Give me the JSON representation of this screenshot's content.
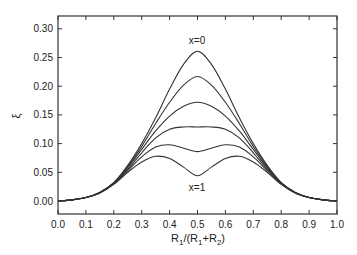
{
  "chart_data": {
    "type": "line",
    "title": "",
    "xlabel": "R1/(R1+R2)",
    "ylabel": "ξ",
    "xlim": [
      0.0,
      1.0
    ],
    "ylim": [
      -0.02,
      0.32
    ],
    "grid": false,
    "legend": null,
    "x_ticks": [
      "0.0",
      "0.1",
      "0.2",
      "0.3",
      "0.4",
      "0.5",
      "0.6",
      "0.7",
      "0.8",
      "0.9",
      "1.0"
    ],
    "y_ticks": [
      "0.00",
      "0.05",
      "0.10",
      "0.15",
      "0.20",
      "0.25",
      "0.30"
    ],
    "annotations": [
      {
        "text": "x=0",
        "x": 0.5,
        "y": 0.275
      },
      {
        "text": "x=1",
        "x": 0.5,
        "y": 0.028
      }
    ],
    "x": [
      0.0,
      0.05,
      0.1,
      0.15,
      0.2,
      0.25,
      0.3,
      0.35,
      0.4,
      0.45,
      0.5,
      0.55,
      0.6,
      0.65,
      0.7,
      0.75,
      0.8,
      0.85,
      0.9,
      0.95,
      1.0
    ],
    "series": [
      {
        "name": "x=0",
        "values": [
          0,
          0.002,
          0.006,
          0.015,
          0.032,
          0.062,
          0.1,
          0.145,
          0.195,
          0.238,
          0.261,
          0.238,
          0.195,
          0.145,
          0.1,
          0.062,
          0.032,
          0.015,
          0.006,
          0.002,
          0
        ]
      },
      {
        "name": "curve 2",
        "values": [
          0,
          0.002,
          0.006,
          0.015,
          0.032,
          0.06,
          0.095,
          0.135,
          0.172,
          0.202,
          0.217,
          0.202,
          0.172,
          0.135,
          0.095,
          0.06,
          0.032,
          0.015,
          0.006,
          0.002,
          0
        ]
      },
      {
        "name": "curve 3",
        "values": [
          0,
          0.002,
          0.006,
          0.015,
          0.031,
          0.058,
          0.09,
          0.122,
          0.148,
          0.165,
          0.172,
          0.165,
          0.148,
          0.122,
          0.09,
          0.058,
          0.031,
          0.015,
          0.006,
          0.002,
          0
        ]
      },
      {
        "name": "curve 4",
        "values": [
          0,
          0.002,
          0.006,
          0.015,
          0.031,
          0.055,
          0.084,
          0.11,
          0.125,
          0.129,
          0.129,
          0.129,
          0.125,
          0.11,
          0.084,
          0.055,
          0.031,
          0.015,
          0.006,
          0.002,
          0
        ]
      },
      {
        "name": "curve 5",
        "values": [
          0,
          0.002,
          0.006,
          0.014,
          0.03,
          0.053,
          0.077,
          0.094,
          0.098,
          0.092,
          0.086,
          0.092,
          0.098,
          0.094,
          0.077,
          0.053,
          0.03,
          0.014,
          0.006,
          0.002,
          0
        ]
      },
      {
        "name": "x=1",
        "values": [
          0,
          0.002,
          0.006,
          0.014,
          0.029,
          0.05,
          0.068,
          0.078,
          0.074,
          0.059,
          0.044,
          0.059,
          0.074,
          0.078,
          0.068,
          0.05,
          0.029,
          0.014,
          0.006,
          0.002,
          0
        ]
      }
    ]
  },
  "labels": {
    "xlabel_main": "R",
    "xlabel_sub1": "1",
    "xlabel_mid": "/(R",
    "xlabel_sub2": "1",
    "xlabel_plus": "+R",
    "xlabel_sub3": "2",
    "xlabel_end": ")",
    "ylabel": "ξ",
    "annot_top": "x=0",
    "annot_bottom": "x=1"
  }
}
